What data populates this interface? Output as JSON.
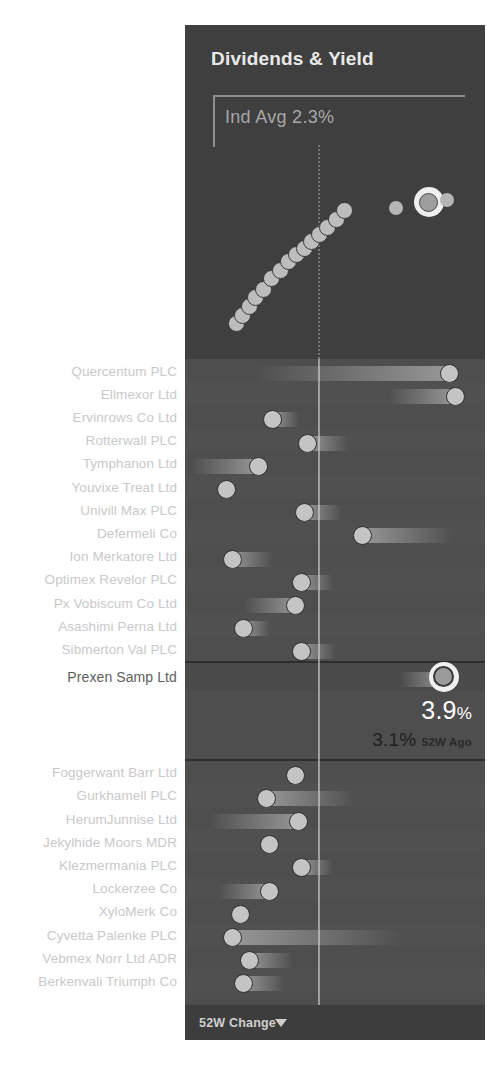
{
  "chart": {
    "title": "Dividends & Yield",
    "industry_average_label": "Ind Avg 2.3%"
  },
  "selection": {
    "name": "Prexen Samp Ltd",
    "current_yield": "3.9",
    "current_unit": "%",
    "previous_yield": "3.1",
    "previous_unit": "%",
    "previous_period_label": "52W Ago"
  },
  "footer": {
    "sort_label": "52W Change",
    "caret_icon": "chevron-down-icon"
  },
  "icons": {
    "cursor": "pointing-hand-cursor-icon"
  },
  "colors": {
    "panel_bg": "#4b4b4b",
    "chart_bg": "#3f3f3f",
    "list_bg": "#4e4e4e",
    "footer_bg": "#3d3d3d",
    "dot": "#c4c4c4",
    "selected_dot_ring": "#f1f1f1",
    "label_text": "#c9c9c9",
    "selected_label_text": "#5e5e5e",
    "reference_line": "#e1e1e1"
  },
  "chart_data": {
    "type": "scatter",
    "title": "Dividends & Yield",
    "xlabel": "",
    "ylabel": "",
    "annotations": [
      "Ind Avg 2.3%"
    ],
    "reference_line_x": 2.3,
    "grid": false,
    "legend": "none",
    "points": [
      {
        "x": 0.3,
        "y": 0.08,
        "highlighted": false
      },
      {
        "x": 0.36,
        "y": 0.14,
        "highlighted": false
      },
      {
        "x": 0.42,
        "y": 0.21,
        "highlighted": false
      },
      {
        "x": 0.48,
        "y": 0.27,
        "highlighted": false
      },
      {
        "x": 0.55,
        "y": 0.33,
        "highlighted": false
      },
      {
        "x": 0.62,
        "y": 0.41,
        "highlighted": false
      },
      {
        "x": 0.7,
        "y": 0.47,
        "highlighted": false
      },
      {
        "x": 0.78,
        "y": 0.53,
        "highlighted": false
      },
      {
        "x": 0.85,
        "y": 0.58,
        "highlighted": false
      },
      {
        "x": 0.92,
        "y": 0.63,
        "highlighted": false
      },
      {
        "x": 0.99,
        "y": 0.68,
        "highlighted": false
      },
      {
        "x": 1.06,
        "y": 0.73,
        "highlighted": false
      },
      {
        "x": 1.13,
        "y": 0.78,
        "highlighted": false
      },
      {
        "x": 1.21,
        "y": 0.84,
        "highlighted": false
      },
      {
        "x": 1.29,
        "y": 0.9,
        "highlighted": false
      },
      {
        "x": 1.75,
        "y": 0.92,
        "highlighted": false
      },
      {
        "x": 2.05,
        "y": 0.96,
        "highlighted": true
      },
      {
        "x": 2.22,
        "y": 0.98,
        "highlighted": false
      }
    ]
  },
  "list": {
    "value_axis_reference": 0,
    "groups": [
      {
        "id": "above",
        "rows": [
          {
            "name": "Quercentum PLC",
            "dot": 0.95,
            "bar_from": 0.28,
            "direction": "up"
          },
          {
            "name": "Ellmexor Ltd",
            "dot": 0.97,
            "bar_from": 0.74,
            "direction": "up"
          },
          {
            "name": "Ervinrows Co Ltd",
            "dot": 0.34,
            "bar_from": 0.43,
            "direction": "down"
          },
          {
            "name": "Rotterwall PLC",
            "dot": 0.46,
            "bar_from": 0.6,
            "direction": "up"
          },
          {
            "name": "Tymphanon Ltd",
            "dot": 0.29,
            "bar_from": 0.06,
            "direction": "up"
          },
          {
            "name": "Youvixe Treat Ltd",
            "dot": 0.18,
            "bar_from": 0.18,
            "direction": "down"
          },
          {
            "name": "Univill Max PLC",
            "dot": 0.45,
            "bar_from": 0.58,
            "direction": "up"
          },
          {
            "name": "Defermeli Co",
            "dot": 0.65,
            "bar_from": 0.96,
            "direction": "up"
          },
          {
            "name": "Ion Merkatore Ltd",
            "dot": 0.2,
            "bar_from": 0.34,
            "direction": "up"
          },
          {
            "name": "Optimex Revelor PLC",
            "dot": 0.44,
            "bar_from": 0.55,
            "direction": "up"
          },
          {
            "name": "Px Vobiscum Co Ltd",
            "dot": 0.42,
            "bar_from": 0.24,
            "direction": "up"
          },
          {
            "name": "Asashimi Perna Ltd",
            "dot": 0.24,
            "bar_from": 0.33,
            "direction": "up"
          },
          {
            "name": "Sibmerton Val PLC",
            "dot": 0.44,
            "bar_from": 0.56,
            "direction": "up"
          }
        ]
      },
      {
        "id": "selected",
        "rows": [
          {
            "name": "Prexen Samp Ltd",
            "dot": 0.93,
            "bar_from": 0.78,
            "direction": "up",
            "selected": true
          }
        ]
      },
      {
        "id": "below",
        "rows": [
          {
            "name": "Foggerwant Barr Ltd",
            "dot": 0.42,
            "bar_from": 0.42,
            "direction": "down"
          },
          {
            "name": "Gurkhamell PLC",
            "dot": 0.32,
            "bar_from": 0.62,
            "direction": "up"
          },
          {
            "name": "HerumJunnise Ltd",
            "dot": 0.43,
            "bar_from": 0.12,
            "direction": "up"
          },
          {
            "name": "Jekylhide Moors MDR",
            "dot": 0.33,
            "bar_from": 0.33,
            "direction": "down"
          },
          {
            "name": "Klezmermania PLC",
            "dot": 0.44,
            "bar_from": 0.55,
            "direction": "up"
          },
          {
            "name": "Lockerzee Co",
            "dot": 0.33,
            "bar_from": 0.16,
            "direction": "up"
          },
          {
            "name": "XyloMerk Co",
            "dot": 0.23,
            "bar_from": 0.23,
            "direction": "down"
          },
          {
            "name": "Cyvetta Palenke PLC",
            "dot": 0.2,
            "bar_from": 0.78,
            "direction": "up"
          },
          {
            "name": "Vebmex Norr Ltd ADR",
            "dot": 0.26,
            "bar_from": 0.41,
            "direction": "up"
          },
          {
            "name": "Berkenvali Triumph Co",
            "dot": 0.24,
            "bar_from": 0.38,
            "direction": "up"
          }
        ]
      }
    ]
  }
}
